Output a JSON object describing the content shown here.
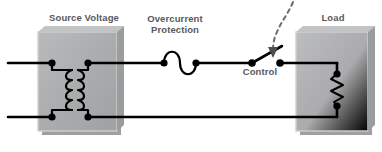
{
  "diagram": {
    "title_labels": {
      "source_voltage": "Source Voltage",
      "overcurrent_protection": "Overcurrent\nProtection",
      "control": "Control",
      "load": "Load"
    },
    "colors": {
      "background": "#ffffff",
      "wire": "#000000",
      "label_text": "#58595b",
      "box_fill": "#a6a8aa",
      "box_fill_light": "#b5b7b9",
      "box_shadow": "#8a8c8e",
      "box_edge": "#d8d9da",
      "dashed_control": "#6d6e70"
    },
    "components": {
      "transformer": {
        "name": "transformer",
        "windings": 2,
        "coil_bumps_per_winding": 4
      },
      "fuse": {
        "name": "overcurrent-protection-fuse",
        "symbol": "s-curve"
      },
      "switch": {
        "name": "control-switch",
        "state": "open",
        "actuation": "dashed-arrow-down"
      },
      "resistor": {
        "name": "load-resistor",
        "symbol": "zigzag",
        "zigzag_peaks": 4
      }
    },
    "nodes": {
      "source_top_left": [
        52,
        63
      ],
      "source_top_right": [
        88,
        63
      ],
      "source_bottom_left": [
        52,
        117
      ],
      "source_bottom_right": [
        88,
        117
      ],
      "fuse_left": [
        164,
        63
      ],
      "fuse_right": [
        196,
        63
      ],
      "switch_pivot": [
        252,
        63
      ],
      "switch_contact": [
        280,
        63
      ],
      "load_top": [
        337,
        63
      ],
      "load_bottom": [
        337,
        117
      ]
    },
    "rails": {
      "top_y": 63,
      "bottom_y": 117,
      "left_x": 8,
      "right_x": 337
    },
    "boxes": {
      "source": {
        "x": 38,
        "y": 32,
        "width": 79,
        "height": 99
      },
      "load": {
        "x": 296,
        "y": 32,
        "width": 72,
        "height": 99
      }
    }
  }
}
